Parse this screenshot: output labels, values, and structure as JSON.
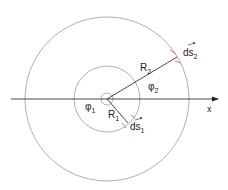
{
  "diagram": {
    "type": "concentric-circles-arc-elements",
    "colors": {
      "circle": "#9a9a9a",
      "line": "#333333",
      "tick": "#e05050",
      "text": "#222222"
    },
    "axis_label": "x",
    "labels": {
      "R1": "R",
      "R1_sub": "1",
      "R2": "R",
      "R2_sub": "2",
      "phi1": "φ",
      "phi1_sub": "1",
      "phi2": "φ",
      "phi2_sub": "2",
      "ds1": "ds",
      "ds1_sub": "1",
      "ds2": "ds",
      "ds2_sub": "2"
    }
  }
}
